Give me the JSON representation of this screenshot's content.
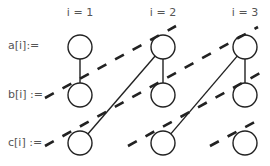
{
  "diagram": {
    "column_headers": [
      {
        "label": "i = 1",
        "x": 80
      },
      {
        "label": "i = 2",
        "x": 163
      },
      {
        "label": "i = 3",
        "x": 245
      }
    ],
    "row_labels": [
      {
        "label": "a[i]:=",
        "y": 46
      },
      {
        "label": "b[i] :=",
        "y": 95
      },
      {
        "label": "c[i] :=",
        "y": 143
      }
    ],
    "nodes": [
      {
        "id": "a1",
        "cx": 80,
        "cy": 47
      },
      {
        "id": "a2",
        "cx": 163,
        "cy": 47
      },
      {
        "id": "a3",
        "cx": 245,
        "cy": 47
      },
      {
        "id": "b1",
        "cx": 80,
        "cy": 95
      },
      {
        "id": "b2",
        "cx": 163,
        "cy": 95
      },
      {
        "id": "b3",
        "cx": 245,
        "cy": 95
      },
      {
        "id": "c1",
        "cx": 80,
        "cy": 143
      },
      {
        "id": "c2",
        "cx": 163,
        "cy": 143
      },
      {
        "id": "c3",
        "cx": 245,
        "cy": 143
      }
    ],
    "node_radius": 12,
    "solid_edges": [
      {
        "from": "a1",
        "to": "b1"
      },
      {
        "from": "a2",
        "to": "b2"
      },
      {
        "from": "a3",
        "to": "b3"
      },
      {
        "from": "a2",
        "to": "c1"
      },
      {
        "from": "a3",
        "to": "c2"
      }
    ],
    "dashed_lines": [
      {
        "x1": 45,
        "y1": 98,
        "x2": 176,
        "y2": 26
      },
      {
        "x1": 45,
        "y1": 146,
        "x2": 258,
        "y2": 27
      },
      {
        "x1": 128,
        "y1": 146,
        "x2": 262,
        "y2": 72
      },
      {
        "x1": 210,
        "y1": 146,
        "x2": 262,
        "y2": 118
      }
    ],
    "colors": {
      "stroke": "#222222",
      "text": "#555555",
      "background": "#ffffff"
    }
  }
}
